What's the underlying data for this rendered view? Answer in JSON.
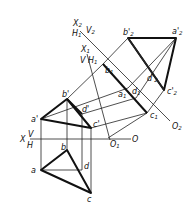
{
  "diagram": {
    "axes": {
      "x": {
        "label": "X",
        "upper": "V",
        "lower": "H",
        "origin": "O"
      },
      "x1": {
        "label": "X1",
        "upper": "V",
        "lower": "H1",
        "origin": "O1"
      },
      "x2": {
        "label": "X2",
        "upper": "V2",
        "lower": "H1",
        "origin": "O2"
      }
    },
    "points": {
      "a_prime": "a'",
      "b_prime": "b'",
      "c_prime": "c'",
      "d_prime": "d'",
      "a": "a",
      "b": "b",
      "c": "c",
      "d": "d",
      "a1": "a1",
      "b1": "b1",
      "c1": "c1",
      "d1": "d1",
      "a2": "a'2",
      "b2": "b'2",
      "c2": "c'2",
      "d2": "d'2"
    },
    "labels": {
      "X": "X",
      "V": "V",
      "H": "H",
      "O": "O",
      "X1": "X",
      "X1_sub": "1",
      "V1": "V",
      "H1": "H",
      "H1_sub": "1",
      "O1": "O",
      "O1_sub": "1",
      "X2": "X",
      "X2_sub": "2",
      "V2": "V",
      "V2_sub": "2",
      "H1b": "H",
      "H1b_sub": "1",
      "O2": "O",
      "O2_sub": "2",
      "a_p": "a'",
      "b_p": "b'",
      "c_p": "c'",
      "d_p": "d'",
      "a": "a",
      "b": "b",
      "c": "c",
      "d": "d",
      "a1": "a",
      "b1": "b",
      "c1": "c",
      "d1": "d",
      "one": "1",
      "a2": "a'",
      "b2": "b'",
      "c2": "c'",
      "d2": "d'",
      "two": "2"
    }
  }
}
